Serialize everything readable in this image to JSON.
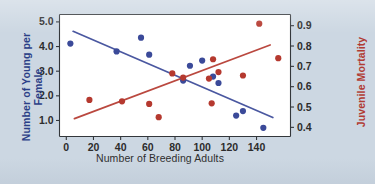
{
  "figure": {
    "background_color": "#ccd7e2",
    "plot_background_color": "#ffffff",
    "blue_color": "#3b4a99",
    "red_color": "#b5392f"
  },
  "chart_data": {
    "type": "scatter",
    "title": "",
    "xlabel": "Number of Breeding Adults",
    "xlim": [
      -5,
      165
    ],
    "xticks": [
      0,
      20,
      40,
      60,
      80,
      100,
      120,
      140
    ],
    "xticklabels": [
      "0",
      "20",
      "40",
      "60",
      "80",
      "100",
      "120",
      "140"
    ],
    "grid": false,
    "legend": "none",
    "axes": [
      {
        "id": "left",
        "label": "Number of Young per Female",
        "color": "#2b3f87",
        "ylim": [
          0.35,
          5.3
        ],
        "yticks": [
          1.0,
          2.0,
          3.0,
          4.0,
          5.0
        ],
        "yticklabels": [
          "1.0",
          "2.0",
          "3.0",
          "4.0",
          "5.0"
        ]
      },
      {
        "id": "right",
        "label": "Juvenile Mortality",
        "color": "#b13b33",
        "ylim": [
          0.355,
          0.955
        ],
        "yticks": [
          0.4,
          0.5,
          0.6,
          0.7,
          0.8,
          0.9
        ],
        "yticklabels": [
          "0.4",
          "0.5",
          "0.6",
          "0.7",
          "0.8",
          "0.9"
        ]
      }
    ],
    "series": [
      {
        "name": "Number of Young per Female",
        "axis": "left",
        "color": "#3b4a99",
        "marker": "circle",
        "points": [
          {
            "x": 3,
            "y": 4.12
          },
          {
            "x": 37,
            "y": 3.8
          },
          {
            "x": 55,
            "y": 4.36
          },
          {
            "x": 61,
            "y": 3.67
          },
          {
            "x": 91,
            "y": 3.22
          },
          {
            "x": 100,
            "y": 3.43
          },
          {
            "x": 86,
            "y": 2.62
          },
          {
            "x": 108,
            "y": 2.78
          },
          {
            "x": 112,
            "y": 2.52
          },
          {
            "x": 125,
            "y": 1.2
          },
          {
            "x": 130,
            "y": 1.38
          },
          {
            "x": 145,
            "y": 0.7
          }
        ],
        "trendline": {
          "x1": 5,
          "y1": 4.62,
          "x2": 152,
          "y2": 1.12
        }
      },
      {
        "name": "Juvenile Mortality",
        "axis": "right",
        "color": "#b5392f",
        "marker": "circle",
        "points": [
          {
            "x": 17,
            "y": 0.535
          },
          {
            "x": 41,
            "y": 0.528
          },
          {
            "x": 61,
            "y": 0.515
          },
          {
            "x": 68,
            "y": 0.45
          },
          {
            "x": 78,
            "y": 0.665
          },
          {
            "x": 86,
            "y": 0.645
          },
          {
            "x": 105,
            "y": 0.64
          },
          {
            "x": 108,
            "y": 0.735
          },
          {
            "x": 107,
            "y": 0.518
          },
          {
            "x": 112,
            "y": 0.672
          },
          {
            "x": 130,
            "y": 0.655
          },
          {
            "x": 142,
            "y": 0.91
          },
          {
            "x": 156,
            "y": 0.74
          }
        ],
        "trendline": {
          "x1": 6,
          "y1": 0.443,
          "x2": 150,
          "y2": 0.805
        }
      }
    ]
  }
}
